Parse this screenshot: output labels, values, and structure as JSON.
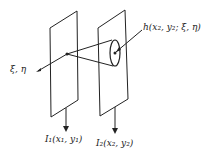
{
  "diagram": {
    "labels": {
      "source_coords": "ξ, η",
      "impulse_response": "h(x₂, y₂; ξ, η)",
      "input_intensity": "I₁(x₁, y₁)",
      "output_intensity": "I₂(x₂, y₂)"
    },
    "colors": {
      "line": "#222222",
      "background": "#ffffff"
    }
  }
}
